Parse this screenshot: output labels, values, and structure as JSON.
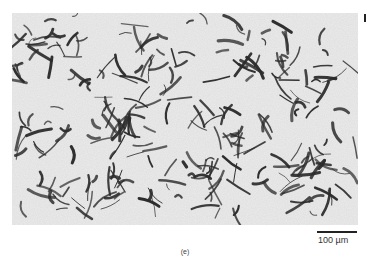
{
  "figure": {
    "panel_label": "(e)",
    "scale_bar": {
      "label": "100 µm",
      "length_px": 40
    },
    "image": {
      "subject": "micrograph-flake-graphite",
      "background_color": "#e9e9e9",
      "feature_color": "#2a2a2a"
    }
  }
}
